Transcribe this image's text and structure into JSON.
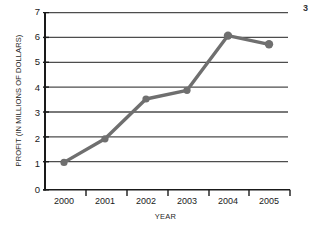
{
  "chart_data": {
    "type": "line",
    "title": "",
    "xlabel": "YEAR",
    "ylabel": "PROFIT (IN MILLIONS OF DOLLARS)",
    "categories": [
      "2000",
      "2001",
      "2002",
      "2003",
      "2004",
      "2005"
    ],
    "values": [
      1.1,
      2.05,
      3.65,
      4.0,
      6.2,
      5.85
    ],
    "series": [
      {
        "name": "Profit",
        "values": [
          1.1,
          2.05,
          3.65,
          4.0,
          6.2,
          5.85
        ]
      }
    ],
    "ylim": [
      0,
      7
    ],
    "yticks": [
      "0",
      "1",
      "2",
      "3",
      "4",
      "5",
      "6",
      "7"
    ],
    "xticks": [
      "2000",
      "2001",
      "2002",
      "2003",
      "2004",
      "2005"
    ],
    "grid": "horizontal",
    "legend": "none",
    "line_color": "#6f6f6f",
    "marker_color": "#6f6f6f",
    "axis_color": "#1a1a1a",
    "grid_color": "#4d4d4d"
  },
  "edge_mark": "3"
}
